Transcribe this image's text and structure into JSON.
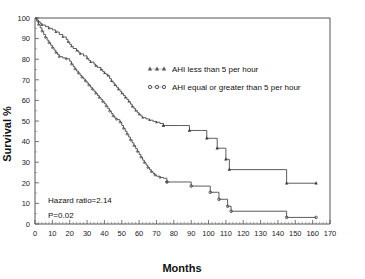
{
  "chart_data": {
    "type": "line",
    "subtype": "kaplan-meier-survival",
    "title": "",
    "xlabel": "Months",
    "ylabel": "Survival %",
    "xlim": [
      0,
      170
    ],
    "ylim": [
      0,
      100
    ],
    "xticks": [
      0,
      10,
      20,
      30,
      40,
      50,
      60,
      70,
      80,
      90,
      100,
      110,
      120,
      130,
      140,
      150,
      160,
      170
    ],
    "yticks": [
      0,
      10,
      20,
      30,
      40,
      50,
      60,
      70,
      80,
      90,
      100
    ],
    "xtick_labels": [
      "0",
      "10",
      "20",
      "30",
      "40",
      "50",
      "60",
      "70",
      "80",
      "90",
      "100",
      "110",
      "120",
      "130",
      "140",
      "150",
      "160",
      "170"
    ],
    "ytick_labels": [
      "0",
      "10",
      "20",
      "30",
      "40",
      "50",
      "60",
      "70",
      "80",
      "90",
      "100"
    ],
    "grid": false,
    "minor_ticks": true,
    "legend_position": "upper-center-right",
    "series": [
      {
        "name": "AHI  less than 5 per hour",
        "marker": "triangle",
        "color": "#4a4a4a",
        "points": [
          [
            0,
            100
          ],
          [
            1,
            99
          ],
          [
            2,
            98.2
          ],
          [
            3,
            97.4
          ],
          [
            4,
            96.6
          ],
          [
            6,
            95.8
          ],
          [
            8,
            95.0
          ],
          [
            10,
            94.2
          ],
          [
            12,
            93.2
          ],
          [
            14,
            92.0
          ],
          [
            16,
            90.8
          ],
          [
            18,
            89.6
          ],
          [
            19,
            88.4
          ],
          [
            20,
            87.2
          ],
          [
            21,
            86.2
          ],
          [
            22,
            85.2
          ],
          [
            24,
            84.2
          ],
          [
            25,
            83.4
          ],
          [
            26,
            82.6
          ],
          [
            28,
            81.6
          ],
          [
            30,
            80.4
          ],
          [
            31,
            79.4
          ],
          [
            32,
            78.6
          ],
          [
            34,
            77.6
          ],
          [
            35,
            76.8
          ],
          [
            36,
            76.0
          ],
          [
            38,
            75.0
          ],
          [
            39,
            74.0
          ],
          [
            40,
            73.2
          ],
          [
            41,
            72.6
          ],
          [
            42,
            72.0
          ],
          [
            43,
            70.6
          ],
          [
            44,
            69.4
          ],
          [
            45,
            68.4
          ],
          [
            46,
            67.4
          ],
          [
            47,
            66.4
          ],
          [
            48,
            65.4
          ],
          [
            49,
            64.4
          ],
          [
            50,
            63.4
          ],
          [
            51,
            62.4
          ],
          [
            52,
            61.4
          ],
          [
            53,
            60.4
          ],
          [
            54,
            59.4
          ],
          [
            55,
            58.2
          ],
          [
            56,
            57.0
          ],
          [
            57,
            56.0
          ],
          [
            58,
            55.0
          ],
          [
            59,
            54.0
          ],
          [
            60,
            53.2
          ],
          [
            61,
            52.4
          ],
          [
            62,
            51.6
          ],
          [
            64,
            51.0
          ],
          [
            66,
            50.4
          ],
          [
            68,
            49.8
          ],
          [
            70,
            49.4
          ],
          [
            72,
            48.8
          ],
          [
            74,
            47.8
          ],
          [
            84,
            47.8
          ],
          [
            89,
            45.4
          ],
          [
            96,
            45.4
          ],
          [
            99,
            41.6
          ],
          [
            103,
            41.6
          ],
          [
            105,
            36.8
          ],
          [
            109,
            36.8
          ],
          [
            110,
            31.4
          ],
          [
            112,
            26.4
          ],
          [
            144,
            26.4
          ],
          [
            145,
            19.8
          ],
          [
            162,
            19.8
          ]
        ],
        "censored": [
          [
            74,
            47.8
          ],
          [
            89,
            45.4
          ],
          [
            99,
            41.6
          ],
          [
            105,
            36.8
          ],
          [
            110,
            31.4
          ],
          [
            112,
            26.4
          ],
          [
            145,
            19.8
          ],
          [
            162,
            19.8
          ]
        ]
      },
      {
        "name": "AHI equal or greater than 5 per hour",
        "marker": "circle",
        "color": "#4a4a4a",
        "points": [
          [
            0,
            100
          ],
          [
            1,
            98.4
          ],
          [
            2,
            96.8
          ],
          [
            3,
            95.2
          ],
          [
            4,
            93.6
          ],
          [
            5,
            92.0
          ],
          [
            6,
            90.6
          ],
          [
            7,
            89.2
          ],
          [
            8,
            88.0
          ],
          [
            9,
            86.8
          ],
          [
            10,
            85.6
          ],
          [
            11,
            84.4
          ],
          [
            12,
            83.2
          ],
          [
            13,
            82.2
          ],
          [
            14,
            81.2
          ],
          [
            16,
            80.6
          ],
          [
            18,
            80.2
          ],
          [
            20,
            79.0
          ],
          [
            21,
            77.6
          ],
          [
            22,
            76.4
          ],
          [
            23,
            75.2
          ],
          [
            24,
            74.2
          ],
          [
            25,
            73.2
          ],
          [
            26,
            72.2
          ],
          [
            27,
            71.2
          ],
          [
            28,
            70.4
          ],
          [
            29,
            69.4
          ],
          [
            30,
            68.4
          ],
          [
            31,
            67.4
          ],
          [
            32,
            66.4
          ],
          [
            33,
            65.4
          ],
          [
            34,
            64.4
          ],
          [
            35,
            63.4
          ],
          [
            36,
            62.4
          ],
          [
            37,
            61.4
          ],
          [
            38,
            60.4
          ],
          [
            39,
            59.4
          ],
          [
            40,
            58.4
          ],
          [
            41,
            57.2
          ],
          [
            42,
            56.0
          ],
          [
            43,
            54.8
          ],
          [
            44,
            53.6
          ],
          [
            45,
            52.4
          ],
          [
            46,
            51.4
          ],
          [
            47,
            50.8
          ],
          [
            48,
            50.6
          ],
          [
            49,
            49.4
          ],
          [
            50,
            47.8
          ],
          [
            51,
            46.4
          ],
          [
            52,
            45.0
          ],
          [
            53,
            43.6
          ],
          [
            54,
            42.2
          ],
          [
            55,
            40.8
          ],
          [
            56,
            39.4
          ],
          [
            57,
            38.0
          ],
          [
            58,
            36.6
          ],
          [
            59,
            35.2
          ],
          [
            60,
            33.8
          ],
          [
            61,
            32.4
          ],
          [
            62,
            31.0
          ],
          [
            63,
            29.8
          ],
          [
            64,
            28.6
          ],
          [
            65,
            27.4
          ],
          [
            66,
            26.4
          ],
          [
            67,
            25.4
          ],
          [
            68,
            24.6
          ],
          [
            69,
            23.8
          ],
          [
            70,
            23.2
          ],
          [
            72,
            22.6
          ],
          [
            74,
            22.2
          ],
          [
            76,
            20.4
          ],
          [
            88,
            20.4
          ],
          [
            90,
            18.4
          ],
          [
            99,
            18.4
          ],
          [
            101,
            15.4
          ],
          [
            105,
            15.4
          ],
          [
            106,
            12.0
          ],
          [
            110,
            12.0
          ],
          [
            111,
            8.6
          ],
          [
            113,
            6.2
          ],
          [
            144,
            6.2
          ],
          [
            145,
            3.2
          ],
          [
            162,
            3.2
          ]
        ],
        "censored": [
          [
            76,
            20.4
          ],
          [
            90,
            18.4
          ],
          [
            101,
            15.4
          ],
          [
            106,
            12.0
          ],
          [
            111,
            8.6
          ],
          [
            113,
            6.2
          ],
          [
            145,
            3.2
          ],
          [
            162,
            3.2
          ]
        ]
      }
    ],
    "annotations": {
      "hazard_ratio": "Hazard ratio=2.14",
      "p_value": "P=0.02"
    }
  },
  "legend": {
    "entries": [
      {
        "label": "AHI  less than 5 per hour",
        "marker": "triangle"
      },
      {
        "label": "AHI equal or greater than 5 per hour",
        "marker": "circle"
      }
    ]
  }
}
